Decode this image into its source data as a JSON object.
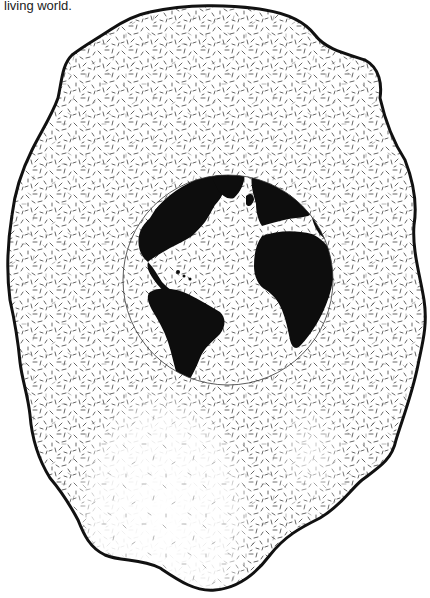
{
  "caption": {
    "text": "living world."
  },
  "illustration": {
    "subject": "globe-in-biosphere-blob",
    "description": "Earth globe showing the Americas, Europe and Africa, surrounded by a dashed-texture irregular blob with a thick black outline; texture fades at the lower part of the blob",
    "colors": {
      "background": "#ffffff",
      "ink": "#111111",
      "texture": "#555555"
    },
    "globe": {
      "cx": 228,
      "cy": 280,
      "r": 105
    },
    "blob_outline_width": 3
  }
}
